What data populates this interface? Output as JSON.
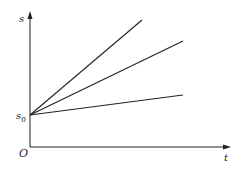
{
  "diagram": {
    "type": "s-t graph",
    "axes": {
      "x_label": "t",
      "y_label": "s",
      "origin_label": "O",
      "intercept_label": "s",
      "intercept_subscript": "0"
    },
    "lines": [
      {
        "name": "steep",
        "from": [
          0,
          "s0"
        ],
        "slope": "high"
      },
      {
        "name": "medium",
        "from": [
          0,
          "s0"
        ],
        "slope": "medium"
      },
      {
        "name": "shallow",
        "from": [
          0,
          "s0"
        ],
        "slope": "low"
      }
    ],
    "colors": {
      "stroke": "#222222",
      "background": "#ffffff"
    }
  }
}
